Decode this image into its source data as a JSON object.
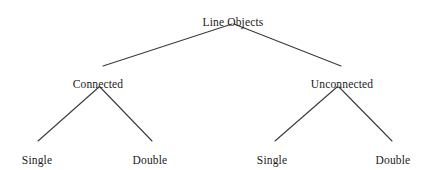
{
  "diagram": {
    "type": "tree",
    "background_color": "#ffffff",
    "line_color": "#3a3a3a",
    "text_color": "#1a1a1a",
    "nodes": [
      {
        "id": "root",
        "label": "Line Objects",
        "level": 0,
        "x": 233,
        "y": 16
      },
      {
        "id": "connected",
        "label": "Connected",
        "level": 1,
        "x": 98,
        "y": 78
      },
      {
        "id": "unconnected",
        "label": "Unconnected",
        "level": 1,
        "x": 342,
        "y": 78
      },
      {
        "id": "connected-single",
        "label": "Single",
        "level": 2,
        "x": 37,
        "y": 154
      },
      {
        "id": "connected-double",
        "label": "Double",
        "level": 2,
        "x": 150,
        "y": 154
      },
      {
        "id": "unconn-single",
        "label": "Single",
        "level": 2,
        "x": 272,
        "y": 154
      },
      {
        "id": "unconn-double",
        "label": "Double",
        "level": 2,
        "x": 393,
        "y": 154
      }
    ],
    "edges": [
      {
        "id": "edge-root-connected",
        "from": "root",
        "to": "connected",
        "x1": 232,
        "y1": 24,
        "x2": 103,
        "y2": 66
      },
      {
        "id": "edge-root-unconnected",
        "from": "root",
        "to": "unconnected",
        "x1": 234,
        "y1": 24,
        "x2": 341,
        "y2": 66
      },
      {
        "id": "edge-connected-single",
        "from": "connected",
        "to": "connected-single",
        "x1": 99,
        "y1": 87,
        "x2": 38,
        "y2": 141
      },
      {
        "id": "edge-connected-double",
        "from": "connected",
        "to": "connected-double",
        "x1": 100,
        "y1": 87,
        "x2": 152,
        "y2": 141
      },
      {
        "id": "edge-unconnected-single",
        "from": "unconnected",
        "to": "unconn-single",
        "x1": 337,
        "y1": 87,
        "x2": 275,
        "y2": 141
      },
      {
        "id": "edge-unconnected-double",
        "from": "unconnected",
        "to": "unconn-double",
        "x1": 339,
        "y1": 87,
        "x2": 392,
        "y2": 141
      }
    ]
  }
}
